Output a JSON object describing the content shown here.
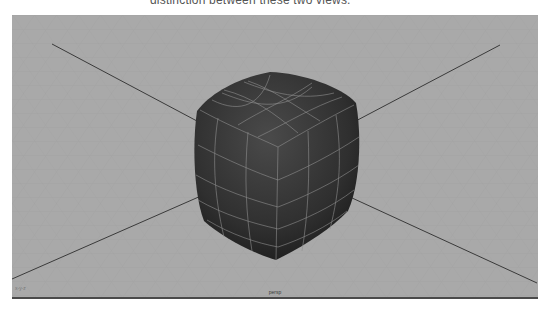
{
  "caption": {
    "text": "distinction between these two views."
  },
  "viewport": {
    "camera_label": "persp",
    "axes_indicator": "x-y-z",
    "background_color": "#a9a9a9",
    "grid_line_color": "#9c9c9c",
    "axis_line_color": "#3a3a3a",
    "object": {
      "name": "smoothed-cube",
      "fill_color": "#333333",
      "wire_color": "#8f8f8f"
    }
  }
}
